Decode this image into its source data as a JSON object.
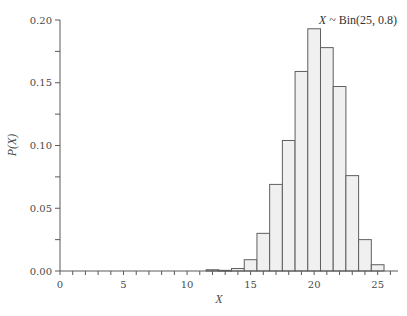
{
  "chart_data": {
    "type": "bar",
    "title": "X ~ Bin(25, 0.8)",
    "title_parts": {
      "var": "X",
      "rest": " ~ Bin(25, 0.8)"
    },
    "xlabel": "X",
    "ylabel": "P(X)",
    "xlim": [
      0,
      26.6
    ],
    "ylim": [
      0,
      0.2
    ],
    "xticks_major": [
      0,
      5,
      10,
      15,
      20,
      25
    ],
    "xtick_labels": [
      "0",
      "5",
      "10",
      "15",
      "20",
      "25"
    ],
    "xticks_minor_step": 1,
    "yticks_major": [
      0.0,
      0.05,
      0.1,
      0.15,
      0.2
    ],
    "ytick_labels": [
      "0.00",
      "0.05",
      "0.10",
      "0.15",
      "0.20"
    ],
    "yticks_minor_step": 0.025,
    "grid": false,
    "legend": null,
    "categories": [
      12,
      13,
      14,
      15,
      16,
      17,
      18,
      19,
      20,
      21,
      22,
      23,
      24,
      25
    ],
    "values": [
      0.001,
      0.0005,
      0.002,
      0.009,
      0.03,
      0.069,
      0.104,
      0.159,
      0.193,
      0.178,
      0.147,
      0.076,
      0.025,
      0.005
    ],
    "bar_fill": "#f0f0f0",
    "bar_edge": "#5f5f5f"
  }
}
